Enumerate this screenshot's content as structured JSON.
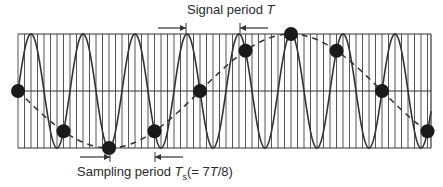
{
  "diagram": {
    "signal_label": {
      "prefix": "Signal period ",
      "symbol": "T"
    },
    "sampling_label": {
      "prefix": "Sampling period ",
      "symbol": "T",
      "subscript": "s",
      "suffix": "(= 7",
      "symbol2": "T",
      "suffix2": "/8)"
    },
    "frame": {
      "left": 18,
      "right": 431,
      "top": 34,
      "bottom": 148
    },
    "signal_period_px": 52,
    "first_peak_x": 31,
    "grid_spacing_px": 6.5,
    "sampling_period_px": 45.5,
    "sample_count": 10,
    "dot_radius": 7,
    "colors": {
      "line": "#333333",
      "grid": "#555555",
      "dot": "#1a1a1a",
      "background": "#ffffff"
    },
    "signal_arrow": {
      "left_tip": 186,
      "left_tail": 158,
      "right_tip": 240,
      "right_tail": 268,
      "y": 28
    },
    "sampling_arrow": {
      "left_tip": 110,
      "left_tail": 80,
      "right_tip": 155,
      "right_tail": 183,
      "y": 157
    }
  }
}
